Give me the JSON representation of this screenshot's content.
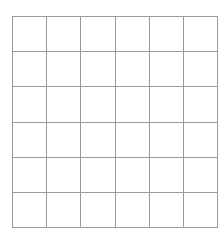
{
  "grid": {
    "rows": 6,
    "cols": 6,
    "line_color": "#9a9a9a",
    "background": "#ffffff",
    "cells": [
      [
        "",
        "",
        "",
        "",
        "",
        ""
      ],
      [
        "",
        "",
        "",
        "",
        "",
        ""
      ],
      [
        "",
        "",
        "",
        "",
        "",
        ""
      ],
      [
        "",
        "",
        "",
        "",
        "",
        ""
      ],
      [
        "",
        "",
        "",
        "",
        "",
        ""
      ],
      [
        "",
        "",
        "",
        "",
        "",
        ""
      ]
    ]
  }
}
